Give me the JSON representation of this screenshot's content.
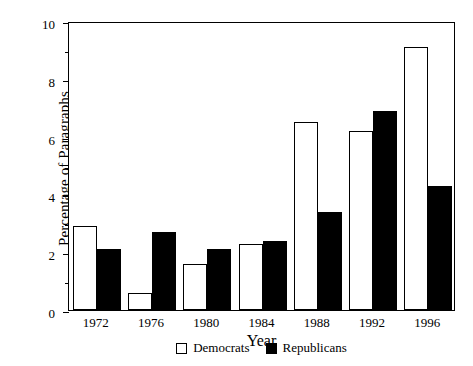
{
  "chart_data": {
    "type": "bar",
    "title": "",
    "subtitle": "",
    "xlabel": "Year",
    "ylabel": "Percentage of Paragraphs",
    "categories": [
      "1972",
      "1976",
      "1980",
      "1984",
      "1988",
      "1992",
      "1996"
    ],
    "series": [
      {
        "name": "Democrats",
        "color": "#ffffff",
        "values": [
          2.9,
          0.6,
          1.6,
          2.3,
          6.5,
          6.2,
          9.1
        ]
      },
      {
        "name": "Republicans",
        "color": "#000000",
        "values": [
          2.1,
          2.7,
          2.1,
          2.4,
          3.4,
          6.9,
          4.3
        ]
      }
    ],
    "ylim": [
      0,
      10
    ],
    "y_ticks": [
      0,
      2,
      4,
      6,
      8,
      10
    ],
    "y_tick_labels": [
      "0",
      "2",
      "4",
      "6",
      "8",
      "10"
    ],
    "y_minor_ticks": [
      1,
      3,
      5,
      7,
      9
    ],
    "grid": false,
    "legend_position": "bottom-center",
    "legend": [
      "Democrats",
      "Republicans"
    ],
    "frame": "box"
  }
}
